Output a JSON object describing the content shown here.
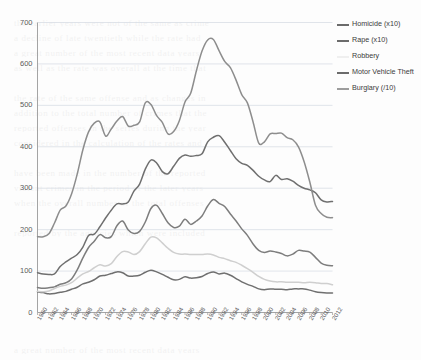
{
  "figure": {
    "background_color": "#fdfdfd",
    "axis_color": "#9a9a9a",
    "gridline_color": "#d8dde4",
    "tick_text_color": "#5b5b5b"
  },
  "ghost_text": [
    "the earlier years were not of the same as crime",
    "a decline of late twentieth while the rate had",
    "a great number of the most recent data years",
    "as well as the rate was overall at the time that",
    "",
    "the rate of the same offense and as changes in",
    "addition to the total number of crimes that the",
    "reported offenses in the series during the year",
    "considered in the calculation of the rates and",
    "",
    "have been made in the number of the reported",
    "violent crimes in the period of the later years",
    "when the overall number of the total offenses",
    "",
    "reported by the agencies which were included"
  ],
  "legend": {
    "position": "right",
    "items": [
      {
        "label": "Homicide (x10)",
        "color": "#6f6f6f",
        "swatch": "legend-swatch-homicide"
      },
      {
        "label": "Rape (x10)",
        "color": "#6f6f6f",
        "swatch": "legend-swatch-rape"
      },
      {
        "label": "Robbery",
        "color": "#efefef",
        "swatch": "legend-swatch-robbery"
      },
      {
        "label": "Motor Vehicle Theft",
        "color": "#6a6a6a",
        "swatch": "legend-swatch-motor-vehicle-theft"
      },
      {
        "label": "Burglary (/10)",
        "color": "#8d8d8d",
        "swatch": "legend-swatch-burglary"
      }
    ]
  },
  "chart_data": {
    "type": "line",
    "title": "",
    "xlabel": "",
    "ylabel": "",
    "xlim": [
      1960,
      2012
    ],
    "ylim": [
      0,
      700
    ],
    "yticks": [
      0,
      100,
      200,
      300,
      400,
      500,
      600,
      700
    ],
    "grid": true,
    "legend_position": "right",
    "x": [
      1960,
      1961,
      1962,
      1963,
      1964,
      1965,
      1966,
      1967,
      1968,
      1969,
      1970,
      1971,
      1972,
      1973,
      1974,
      1975,
      1976,
      1977,
      1978,
      1979,
      1980,
      1981,
      1982,
      1983,
      1984,
      1985,
      1986,
      1987,
      1988,
      1989,
      1990,
      1991,
      1992,
      1993,
      1994,
      1995,
      1996,
      1997,
      1998,
      1999,
      2000,
      2001,
      2002,
      2003,
      2004,
      2005,
      2006,
      2007,
      2008,
      2009,
      2010,
      2011,
      2012
    ],
    "xticks": [
      1960,
      1962,
      1964,
      1966,
      1968,
      1970,
      1972,
      1974,
      1976,
      1978,
      1980,
      1982,
      1984,
      1986,
      1988,
      1990,
      1992,
      1994,
      1996,
      1998,
      2000,
      2002,
      2004,
      2006,
      2008,
      2010,
      2012
    ],
    "series": [
      {
        "name": "Robbery",
        "legend_label": "Robbery",
        "color": "#efefef",
        "render_color": "#7d7d7d",
        "values": [
          60.1,
          58.3,
          59.7,
          61.8,
          68.2,
          71.7,
          80.9,
          102.8,
          131.8,
          157.0,
          172.1,
          188.0,
          180.7,
          183.1,
          209.3,
          220.8,
          199.3,
          190.7,
          195.8,
          218.4,
          251.1,
          258.7,
          238.9,
          216.5,
          205.4,
          208.5,
          225.1,
          212.7,
          220.9,
          233.0,
          257.0,
          272.7,
          263.6,
          255.9,
          237.7,
          220.9,
          201.9,
          186.2,
          165.5,
          150.1,
          145.0,
          148.5,
          146.1,
          142.5,
          136.7,
          140.8,
          150.0,
          148.3,
          145.9,
          133.1,
          119.3,
          113.9,
          112.9
        ]
      },
      {
        "name": "Homicide (x10)",
        "legend_label": "Homicide (x10)",
        "color": "#6f6f6f",
        "values": [
          50,
          48,
          45,
          46,
          49,
          51,
          56,
          61,
          69,
          73,
          79,
          88,
          90,
          94,
          98,
          96,
          88,
          88,
          90,
          97,
          102,
          98,
          92,
          85,
          79,
          80,
          86,
          83,
          84,
          87,
          94,
          98,
          93,
          95,
          90,
          82,
          74,
          68,
          63,
          57,
          55,
          57,
          56,
          56,
          55,
          57,
          57,
          57,
          54,
          50,
          48,
          47,
          47
        ]
      },
      {
        "name": "Rape (x10)",
        "legend_label": "Rape (x10)",
        "color": "#6f6f6f",
        "values": [
          96,
          93,
          92,
          93,
          111,
          122,
          131,
          140,
          158,
          186,
          189,
          207,
          228,
          247,
          262,
          262,
          267,
          293,
          310,
          346,
          368,
          361,
          340,
          335,
          353,
          372,
          380,
          377,
          379,
          383,
          412,
          423,
          427,
          411,
          391,
          371,
          360,
          355,
          343,
          329,
          320,
          316,
          331,
          321,
          323,
          317,
          307,
          300,
          296,
          289,
          272,
          267,
          268
        ]
      },
      {
        "name": "Motor Vehicle Theft",
        "legend_label": "Motor Vehicle Theft",
        "color": "#8d8d8d",
        "values": [
          183,
          183,
          190,
          216,
          247,
          257,
          286,
          334,
          393,
          436,
          457,
          460,
          426,
          443,
          462,
          473,
          450,
          452,
          460,
          506,
          502,
          475,
          459,
          431,
          437,
          463,
          508,
          529,
          583,
          631,
          658,
          659,
          632,
          606,
          591,
          561,
          526,
          506,
          460,
          409,
          412,
          431,
          432,
          433,
          422,
          417,
          400,
          364,
          315,
          259,
          239,
          230,
          229
        ]
      },
      {
        "name": "Burglary (/10)",
        "legend_label": "Burglary (/10)",
        "color": "#cfcfcf",
        "values": [
          51,
          50,
          52,
          58,
          63,
          66,
          72,
          83,
          93,
          99,
          108,
          115,
          112,
          118,
          135,
          147,
          146,
          140,
          147,
          166,
          182,
          180,
          168,
          155,
          145,
          141,
          141,
          140,
          140,
          140,
          141,
          139,
          133,
          130,
          125,
          121,
          114,
          106,
          97,
          87,
          80,
          76,
          74,
          74,
          73,
          73,
          73,
          72,
          73,
          72,
          70,
          70,
          67
        ]
      }
    ]
  }
}
